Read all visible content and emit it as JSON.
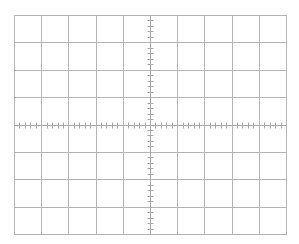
{
  "graticule": {
    "name": "oscilloscope-graticule",
    "background": "#ffffff",
    "line_color": "#b4b4b4",
    "axis_color": "#a8a8a8",
    "left": 14,
    "top": 15,
    "right": 286,
    "bottom": 234,
    "divisions_x": 10,
    "divisions_y": 8,
    "minor_ticks_per_division": 5,
    "minor_tick_length": 6
  }
}
